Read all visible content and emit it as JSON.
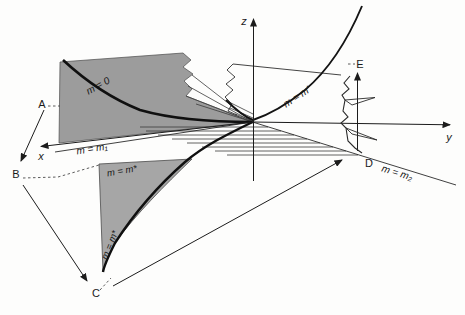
{
  "figure": {
    "colors": {
      "background": "#fdfdfc",
      "ink": "#2a2a2a",
      "curve_ink": "#101010",
      "plane_fill": "#9c9c9c",
      "sliver_fill": "#a6a6a6"
    },
    "axes": {
      "x": "x",
      "y": "y",
      "z": "z"
    },
    "points": {
      "a": "A",
      "b": "B",
      "c": "C",
      "d": "D",
      "e": "E"
    },
    "curve_labels": {
      "m0": "m = 0",
      "m1": "m = m₁",
      "mprime": "m = m′",
      "mstar_top": "m = m*",
      "mstar_side": "m = m*",
      "m2": "m = m₂"
    }
  }
}
